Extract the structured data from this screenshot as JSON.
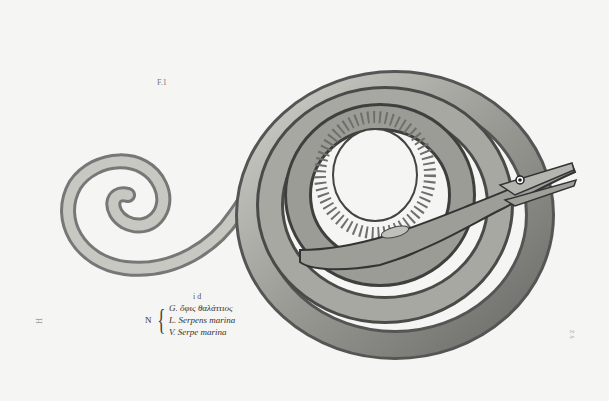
{
  "image": {
    "description": "Engraved illustration of a sea serpent / snake eel coiled in a spiral with head raised to the right and tail curling to the left",
    "colors": {
      "paper": "#f5f5f3",
      "ink_dark": "#2a2a2a",
      "body_mid": "#8a8a86",
      "body_light": "#c9c9c4"
    }
  },
  "labels": {
    "figure_mark": "F.1",
    "id_mark": "i d",
    "caption_prefix": "N",
    "caption_lines": [
      "G. ὄφις θαλάττιος",
      "L. Serpens marina",
      "V. Serpe marina"
    ],
    "left_margin_mark": "H",
    "right_margin_mark": "z s"
  }
}
